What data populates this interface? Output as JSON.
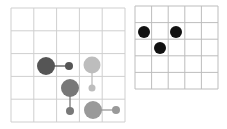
{
  "left_grid": {
    "x": 11,
    "y": 8,
    "cols": 5,
    "rows": 5,
    "cell": 22.8,
    "line_color": "#cfcfcf",
    "pieces": [
      {
        "id": "dark-large",
        "cx": 46,
        "cy": 66,
        "r": 9,
        "color": "#555555"
      },
      {
        "id": "dark-small",
        "cx": 69,
        "cy": 66,
        "r": 4,
        "color": "#555555"
      },
      {
        "id": "light-large",
        "cx": 92,
        "cy": 65,
        "r": 8.5,
        "color": "#bdbdbd"
      },
      {
        "id": "light-small",
        "cx": 92,
        "cy": 88,
        "r": 3.5,
        "color": "#bdbdbd"
      },
      {
        "id": "mid-large",
        "cx": 70,
        "cy": 88,
        "r": 9,
        "color": "#787878"
      },
      {
        "id": "mid-small",
        "cx": 70,
        "cy": 111,
        "r": 4,
        "color": "#787878"
      },
      {
        "id": "gray-large",
        "cx": 93,
        "cy": 110,
        "r": 9,
        "color": "#999999"
      },
      {
        "id": "gray-small",
        "cx": 116,
        "cy": 110,
        "r": 4,
        "color": "#999999"
      }
    ],
    "links": [
      {
        "x1": 46,
        "y1": 66,
        "x2": 69,
        "y2": 66,
        "color": "#555555"
      },
      {
        "x1": 92,
        "y1": 65,
        "x2": 92,
        "y2": 88,
        "color": "#bdbdbd"
      },
      {
        "x1": 70,
        "y1": 88,
        "x2": 70,
        "y2": 111,
        "color": "#787878"
      },
      {
        "x1": 93,
        "y1": 110,
        "x2": 116,
        "y2": 110,
        "color": "#999999"
      }
    ]
  },
  "right_grid": {
    "x": 135,
    "y": 6,
    "cols": 5,
    "rows": 5,
    "cell": 16.6,
    "line_color": "#bdbdbd",
    "pieces": [
      {
        "id": "black-1",
        "cx": 144,
        "cy": 32,
        "r": 6,
        "color": "#111111"
      },
      {
        "id": "black-2",
        "cx": 176,
        "cy": 32,
        "r": 6,
        "color": "#111111"
      },
      {
        "id": "black-3",
        "cx": 160,
        "cy": 48,
        "r": 6,
        "color": "#111111"
      }
    ]
  }
}
